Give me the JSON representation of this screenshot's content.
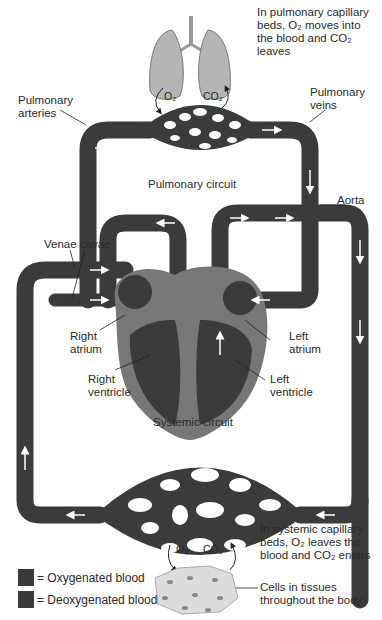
{
  "diagram": {
    "labels": {
      "pulmonary_capillary_note": [
        "In pulmonary capillary",
        "beds, O₂ moves into",
        "the blood and CO₂",
        "leaves"
      ],
      "pulmonary_arteries": [
        "Pulmonary",
        "arteries"
      ],
      "pulmonary_veins": [
        "Pulmonary",
        "veins"
      ],
      "pulmonary_circuit": "Pulmonary circuit",
      "aorta": "Aorta",
      "venae_cavae": "Venae cavae",
      "right_atrium": [
        "Right",
        "atrium"
      ],
      "left_atrium": [
        "Left",
        "atrium"
      ],
      "right_ventricle": [
        "Right",
        "ventricle"
      ],
      "left_ventricle": [
        "Left",
        "ventricle"
      ],
      "systemic_circuit": "Systemic circuit",
      "systemic_capillary_note": [
        "In systemic capillary",
        "beds, O₂ leaves the",
        "blood and CO₂ enters"
      ],
      "lungs_o2": "O₂",
      "lungs_co2": "CO₂",
      "tissue_o2": "O₂",
      "tissue_co2": "CO₂",
      "cells": [
        "Cells in tissues",
        "throughout the body"
      ]
    },
    "legend": [
      {
        "label": "= Oxygenated blood",
        "color": "#3a3a3a"
      },
      {
        "label": "= Deoxygenated blood",
        "color": "#3a3a3a"
      }
    ],
    "colors": {
      "vessel": "#3b3b3b",
      "vessel_highlight": "#5a5a5a",
      "heart_wall": "#777777",
      "lung": "#b5b5b5",
      "cells": "#dcdcdc"
    }
  }
}
